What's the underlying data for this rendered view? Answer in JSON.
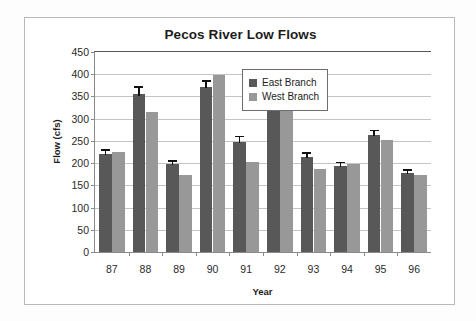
{
  "chart_data": {
    "type": "bar",
    "title": "Pecos River Low Flows",
    "xlabel": "Year",
    "ylabel": "Flow (cfs)",
    "categories": [
      "87",
      "88",
      "89",
      "90",
      "91",
      "92",
      "93",
      "94",
      "95",
      "96"
    ],
    "ylim": [
      0,
      450
    ],
    "yticks": [
      0,
      50,
      100,
      150,
      200,
      250,
      300,
      350,
      400,
      450
    ],
    "ytick_labels": [
      "0",
      "50",
      "100",
      "150",
      "200",
      "250",
      "300",
      "350",
      "400",
      "450"
    ],
    "grid": true,
    "legend_position": "top-right",
    "series": [
      {
        "name": "East Branch",
        "color": "#585858",
        "values": [
          220,
          355,
          198,
          372,
          248,
          323,
          214,
          194,
          264,
          178
        ],
        "errors": [
          11,
          18,
          9,
          14,
          14,
          18,
          10,
          9,
          11,
          8
        ],
        "has_error_bars": true
      },
      {
        "name": "West Branch",
        "color": "#989898",
        "values": [
          224,
          315,
          174,
          398,
          203,
          326,
          187,
          199,
          252,
          174
        ],
        "has_error_bars": false
      }
    ]
  },
  "chart": {
    "title": "Pecos River Low Flows",
    "y_axis_title": "Flow (cfs)",
    "x_axis_title": "Year"
  },
  "legend": {
    "entries": [
      {
        "label": "East Branch",
        "color": "#585858"
      },
      {
        "label": "West Branch",
        "color": "#989898"
      }
    ]
  },
  "colors": {
    "east_branch": "#585858",
    "west_branch": "#989898",
    "gridline": "#c4c4c4",
    "axis": "#8a8a8a",
    "frame": "#b9b9b9",
    "text": "#1c1c1c"
  }
}
